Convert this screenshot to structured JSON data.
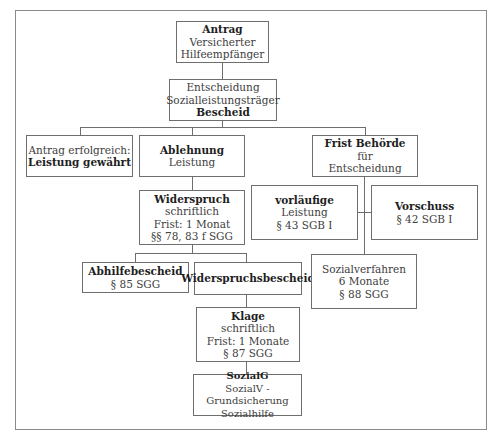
{
  "diagram": {
    "nodes": {
      "antrag": {
        "title": "Antrag",
        "lines": [
          "Versicherter",
          "Hilfeempfänger"
        ]
      },
      "entscheidung": {
        "lines": [
          "Entscheidung",
          "Sozialleistungsträger"
        ],
        "footer": "Bescheid"
      },
      "erfolgreich": {
        "lines": [
          "Antrag erfolgreich:"
        ],
        "footer": "Leistung gewährt"
      },
      "ablehnung": {
        "title": "Ablehnung",
        "lines": [
          "Leistung"
        ]
      },
      "frist_behoerde": {
        "title": "Frist Behörde",
        "lines": [
          "für",
          "Entscheidung"
        ]
      },
      "widerspruch": {
        "title": "Widerspruch",
        "lines": [
          "schriftlich",
          "Frist: 1 Monat",
          "§§ 78, 83 f SGG"
        ]
      },
      "vorlaeufige": {
        "title": "vorläufige",
        "lines": [
          "Leistung",
          "§ 43 SGB I"
        ]
      },
      "vorschuss": {
        "title": "Vorschuss",
        "lines": [
          "§ 42 SGB I"
        ]
      },
      "abhilfebescheid": {
        "title": "Abhilfebescheid",
        "lines": [
          "§ 85 SGG"
        ]
      },
      "widerspruchsbescheid": {
        "title": "Widerspruchsbescheid"
      },
      "sozialverfahren": {
        "lines": [
          "Sozialverfahren",
          "6 Monate",
          "§ 88 SGG"
        ]
      },
      "klage": {
        "title": "Klage",
        "lines": [
          "schriftlich",
          "Frist: 1 Monate",
          "§ 87 SGG"
        ]
      },
      "sozialg": {
        "title": "SozialG",
        "lines": [
          "SozialV - Grundsicherung",
          "Sozialhilfe"
        ]
      }
    }
  }
}
